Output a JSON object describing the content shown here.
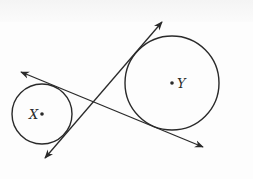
{
  "diagram": {
    "type": "geometry",
    "circles": [
      {
        "id": "circle-x",
        "label": "X",
        "center": [
          42,
          114
        ],
        "radius": 30
      },
      {
        "id": "circle-y",
        "label": "Y",
        "center": [
          172,
          83
        ],
        "radius": 47
      }
    ],
    "lines": [
      {
        "id": "tangent-1",
        "description": "common internal tangent, upper-left to lower-right",
        "from": [
          21,
          72
        ],
        "to": [
          203,
          147
        ],
        "arrows": "both"
      },
      {
        "id": "tangent-2",
        "description": "common internal tangent, lower-left to upper-right",
        "from": [
          45,
          158
        ],
        "to": [
          162,
          22
        ],
        "arrows": "both"
      }
    ],
    "labels": {
      "x": "X",
      "y": "Y"
    },
    "colors": {
      "stroke": "#2a2a2a",
      "background": "#fdfdfd"
    }
  }
}
